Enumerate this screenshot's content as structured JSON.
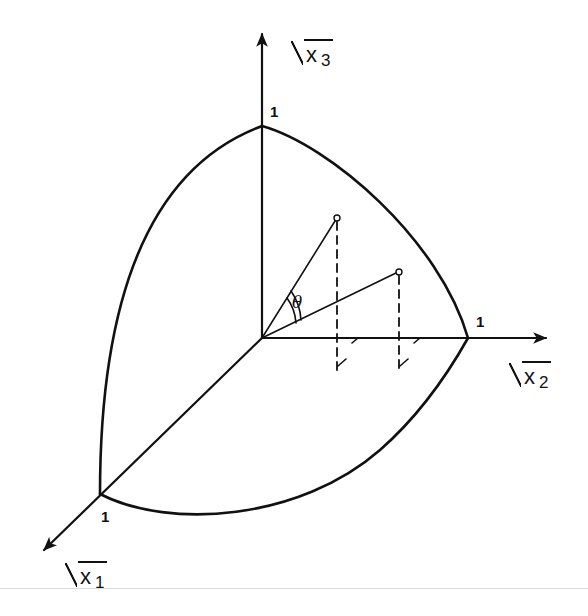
{
  "figure": {
    "type": "3D coordinate diagram (positive octant of unit sphere in square-root coordinates)",
    "axes": [
      {
        "id": "x3",
        "label_var": "x",
        "label_sub": "3",
        "direction": "up",
        "unit_mark": "1"
      },
      {
        "id": "x2",
        "label_var": "x",
        "label_sub": "2",
        "direction": "right",
        "unit_mark": "1"
      },
      {
        "id": "x1",
        "label_var": "x",
        "label_sub": "1",
        "direction": "down-left",
        "unit_mark": "1"
      }
    ],
    "angle_label": "θ",
    "points": [
      {
        "name": "P1",
        "x": 337,
        "y": 218
      },
      {
        "name": "P2",
        "x": 399,
        "y": 272
      }
    ],
    "colors": {
      "stroke": "#111111",
      "background": "#ffffff",
      "rule": "#dcdcdc"
    }
  }
}
